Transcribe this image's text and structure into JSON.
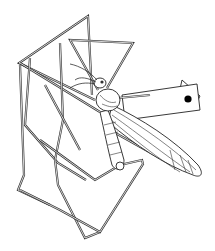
{
  "figure": {
    "elements": [
      "legs",
      "wing",
      "thorax",
      "head",
      "antennae",
      "specimen-label"
    ],
    "colors": {
      "line": "#333333",
      "background": "#ffffff",
      "label_dot": "#000000"
    }
  }
}
